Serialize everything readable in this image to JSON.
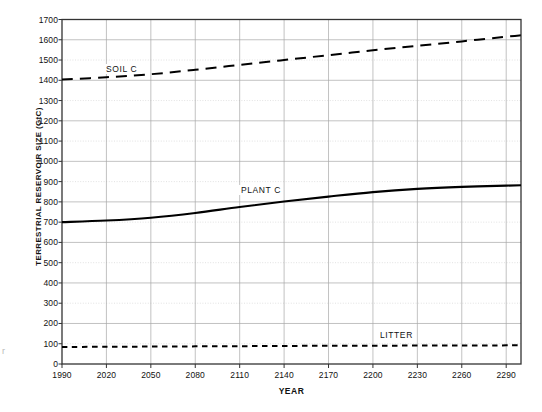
{
  "chart_data": {
    "type": "line",
    "title": "",
    "xlabel": "YEAR",
    "ylabel": "TERRESTRIAL RESERVOIR SIZE (GtC)",
    "xlim": [
      1990,
      2300
    ],
    "ylim": [
      0,
      1700
    ],
    "xticks": [
      1990,
      2020,
      2050,
      2080,
      2110,
      2140,
      2170,
      2200,
      2230,
      2260,
      2290
    ],
    "yticks": [
      0,
      100,
      200,
      300,
      400,
      500,
      600,
      700,
      800,
      900,
      1000,
      1100,
      1200,
      1300,
      1400,
      1500,
      1600,
      1700
    ],
    "grid": true,
    "legend_position": "inline-annotations",
    "series": [
      {
        "name": "SOIL C",
        "style": "dashed",
        "color": "#000000",
        "x": [
          1990,
          2020,
          2050,
          2080,
          2110,
          2140,
          2170,
          2200,
          2230,
          2260,
          2290,
          2300
        ],
        "values": [
          1404,
          1415,
          1430,
          1452,
          1476,
          1500,
          1524,
          1548,
          1570,
          1592,
          1615,
          1622
        ]
      },
      {
        "name": "PLANT C",
        "style": "solid",
        "color": "#000000",
        "x": [
          1990,
          2020,
          2050,
          2080,
          2110,
          2140,
          2170,
          2200,
          2230,
          2260,
          2290,
          2300
        ],
        "values": [
          700,
          708,
          722,
          745,
          775,
          802,
          826,
          848,
          864,
          874,
          880,
          882
        ]
      },
      {
        "name": "LITTER",
        "style": "dotted-dashed",
        "color": "#000000",
        "x": [
          1990,
          2020,
          2050,
          2080,
          2110,
          2140,
          2170,
          2200,
          2230,
          2260,
          2290,
          2300
        ],
        "values": [
          84,
          85,
          86,
          87,
          88,
          89,
          90,
          90,
          91,
          91,
          92,
          92
        ]
      }
    ],
    "annotations": [
      {
        "text": "SOIL C",
        "x": 2025,
        "y": 1490
      },
      {
        "text": "PLANT C",
        "x": 2140,
        "y": 905
      },
      {
        "text": "LITTER",
        "x": 2215,
        "y": 175
      }
    ]
  },
  "axis": {
    "y_title": "TERRESTRIAL RESERVOIR SIZE (GtC)",
    "x_title": "YEAR",
    "y_tick_labels": [
      "1700",
      "1600",
      "1500",
      "1400",
      "1300",
      "1200",
      "1100",
      "1000",
      "900",
      "800",
      "700",
      "600",
      "500",
      "400",
      "300",
      "200",
      "100",
      "0"
    ],
    "x_tick_labels": [
      "1990",
      "2020",
      "2050",
      "2080",
      "2110",
      "2140",
      "2170",
      "2200",
      "2230",
      "2260",
      "2290"
    ]
  },
  "labels": {
    "soil": "SOIL C",
    "plant": "PLANT C",
    "litter": "LITTER"
  },
  "colors": {
    "line": "#000000",
    "grid": "#a8a8a8",
    "grid_minor": "#cfcfcf",
    "frame": "#333333",
    "background": "#ffffff"
  },
  "artifact": {
    "speck": "r"
  }
}
